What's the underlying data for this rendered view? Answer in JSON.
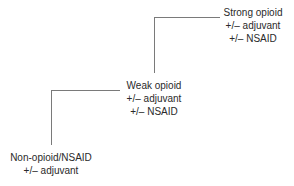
{
  "diagram": {
    "type": "analgesic-ladder",
    "line_color": "#7a7a7a",
    "text_color": "#2a2a2a",
    "steps": [
      {
        "level": 1,
        "lines": [
          "Non-opioid/NSAID",
          "+/– adjuvant"
        ]
      },
      {
        "level": 2,
        "lines": [
          "Weak opioid",
          "+/– adjuvant",
          "+/– NSAID"
        ]
      },
      {
        "level": 3,
        "lines": [
          "Strong opioid",
          "+/– adjuvant",
          "+/– NSAID"
        ]
      }
    ]
  }
}
